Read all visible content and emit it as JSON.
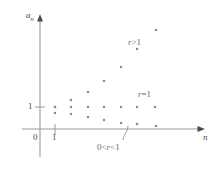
{
  "figure": {
    "type": "scatter",
    "background_color": "#ffffff",
    "axis_color": "#9a9a9a",
    "point_color": "#8a8a8a",
    "text_color": "#4a4a4a",
    "region_text_color": "#6d6d6d"
  },
  "axes": {
    "y_label": "a",
    "y_label_sub": "n",
    "x_label": "n",
    "y_tick_label": "1",
    "x_tick_label": "1",
    "origin_label": "0"
  },
  "regions": [
    {
      "id": "r-greater-than-1",
      "text_r": "r",
      "op1": ">",
      "value": "1"
    },
    {
      "id": "r-equals-1",
      "text_r": "r",
      "op1": "=",
      "value": "1"
    },
    {
      "id": "r-between-0-and-1",
      "lead": "0",
      "op1": "<",
      "text_r": "r",
      "op2": "<",
      "value": "1"
    }
  ],
  "chart_data": {
    "type": "scatter",
    "title": "",
    "xlabel": "n",
    "ylabel": "a_n",
    "xlim": [
      0,
      8
    ],
    "ylim": [
      0,
      4
    ],
    "grid": false,
    "legend": "inline-annotations",
    "axis_origin_px": {
      "x": 40,
      "y": 129
    },
    "unit_px": {
      "x": 15.5,
      "y": 22
    },
    "series": [
      {
        "name": "r > 1",
        "annotation": "r > 1",
        "x": [
          1,
          2,
          3,
          4,
          5,
          6,
          7
        ],
        "y": [
          1.0,
          1.33,
          1.7,
          2.2,
          2.85,
          3.6,
          4.6
        ],
        "points_px": [
          {
            "x": 55,
            "y": 107
          },
          {
            "x": 71,
            "y": 100
          },
          {
            "x": 88,
            "y": 92
          },
          {
            "x": 104,
            "y": 81
          },
          {
            "x": 121,
            "y": 67
          },
          {
            "x": 137,
            "y": 49
          },
          {
            "x": 156,
            "y": 30
          }
        ]
      },
      {
        "name": "r = 1",
        "annotation": "r = 1",
        "x": [
          1,
          2,
          3,
          4,
          5,
          6,
          7
        ],
        "y": [
          1,
          1,
          1,
          1,
          1,
          1,
          1
        ],
        "points_px": [
          {
            "x": 55,
            "y": 107
          },
          {
            "x": 71,
            "y": 107
          },
          {
            "x": 88,
            "y": 107
          },
          {
            "x": 104,
            "y": 107
          },
          {
            "x": 121,
            "y": 107
          },
          {
            "x": 137,
            "y": 107
          },
          {
            "x": 155,
            "y": 107
          }
        ]
      },
      {
        "name": "0 < r < 1",
        "annotation": "0 < r < 1",
        "x": [
          1,
          2,
          3,
          4,
          5,
          6,
          7
        ],
        "y": [
          1.0,
          0.72,
          0.5,
          0.34,
          0.22,
          0.14,
          0.08
        ],
        "points_px": [
          {
            "x": 55,
            "y": 113
          },
          {
            "x": 71,
            "y": 114
          },
          {
            "x": 88,
            "y": 117
          },
          {
            "x": 104,
            "y": 120
          },
          {
            "x": 121,
            "y": 123
          },
          {
            "x": 137,
            "y": 124
          },
          {
            "x": 156,
            "y": 126
          }
        ]
      }
    ],
    "callout": {
      "name": "brace-pointer",
      "target_px": {
        "x": 127,
        "y": 127
      },
      "tip_px": {
        "x": 122,
        "y": 141
      }
    }
  }
}
